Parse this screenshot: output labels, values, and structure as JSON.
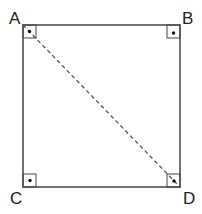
{
  "diagram": {
    "vertices": [
      {
        "label": "A",
        "x": 23,
        "y": 25
      },
      {
        "label": "B",
        "x": 180,
        "y": 25
      },
      {
        "label": "C",
        "x": 23,
        "y": 187
      },
      {
        "label": "D",
        "x": 180,
        "y": 187
      }
    ],
    "diagonal": {
      "from": "A",
      "to": "D",
      "style": "dashed"
    },
    "right_angle_markers": [
      "A",
      "B",
      "C",
      "D"
    ],
    "colors": {
      "line": "#333333",
      "text": "#222222"
    }
  }
}
